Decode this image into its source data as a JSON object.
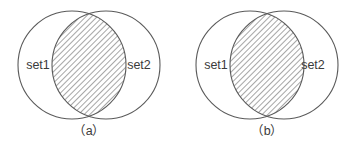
{
  "figure": {
    "type": "venn-diagram-pair",
    "background_color": "#ffffff",
    "outline_color": "#5a5a5a",
    "hatch_color": "#8a8a8a",
    "text_color": "#3a3a3a",
    "panels": [
      {
        "id": "a",
        "caption": "（a）",
        "left_circle_label": "set1",
        "right_circle_label": "set2",
        "shaded_region": "intersection"
      },
      {
        "id": "b",
        "caption": "（b）",
        "left_circle_label": "set1",
        "right_circle_label": "set2",
        "shaded_region": "intersection"
      }
    ]
  }
}
